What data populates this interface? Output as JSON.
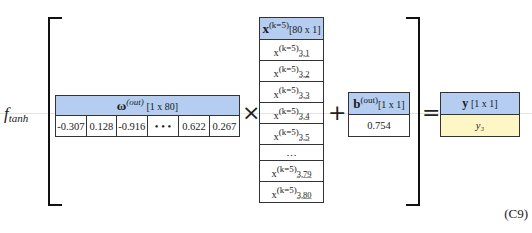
{
  "function_label": {
    "name": "f",
    "subscript": "tanh"
  },
  "omega": {
    "symbol": "ω",
    "superscript": "(out)",
    "dims": "[1 x 80]",
    "values": [
      "-0.307",
      "0.128",
      "-0.916",
      "• • •",
      "0.622",
      "0.267"
    ]
  },
  "x_vector": {
    "symbol": "x",
    "superscript": "(k=5)",
    "dims": "[80 x 1]",
    "rows": [
      {
        "label": "x",
        "sup": "(k=5)",
        "sub": "3,1"
      },
      {
        "label": "x",
        "sup": "(k=5)",
        "sub": "3,2"
      },
      {
        "label": "x",
        "sup": "(k=5)",
        "sub": "3,3"
      },
      {
        "label": "x",
        "sup": "(k=5)",
        "sub": "3,4"
      },
      {
        "label": "x",
        "sup": "(k=5)",
        "sub": "3,5"
      },
      {
        "label": "…",
        "sup": "",
        "sub": ""
      },
      {
        "label": "x",
        "sup": "(k=5)",
        "sub": "3,79"
      },
      {
        "label": "x",
        "sup": "(k=5)",
        "sub": "3,80"
      }
    ]
  },
  "bias": {
    "symbol": "b",
    "superscript": "(out)",
    "dims": "[1 x 1]",
    "value": "0.754"
  },
  "output": {
    "symbol": "y",
    "dims": "[1 x 1]",
    "value": "y₃"
  },
  "operators": {
    "multiply": "×",
    "plus": "+",
    "equals": "="
  },
  "equation_number": "(C9)",
  "colors": {
    "header": "#b4cdf0",
    "output_cell": "#fff6c6"
  }
}
